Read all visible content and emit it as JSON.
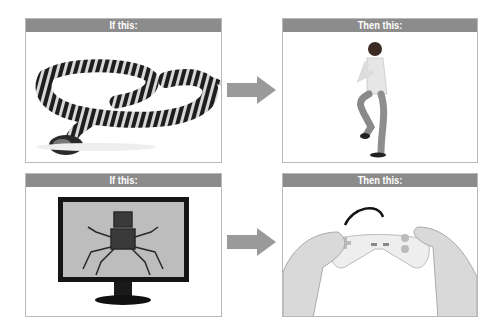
{
  "diagram": {
    "rows": [
      {
        "if_panel": {
          "header": "If this:",
          "image": "snake-photo"
        },
        "then_panel": {
          "header": "Then this:",
          "image": "man-dancing-photo"
        }
      },
      {
        "if_panel": {
          "header": "If this:",
          "image": "monitor-robot-spider-photo"
        },
        "then_panel": {
          "header": "Then this:",
          "image": "hands-holding-gamepad-photo"
        }
      }
    ],
    "arrow_icon": "right-arrow-icon",
    "colors": {
      "header_bg": "#8c8c8c",
      "header_text": "#ffffff",
      "border": "#b9b9b9",
      "arrow": "#9a9a9a"
    }
  }
}
